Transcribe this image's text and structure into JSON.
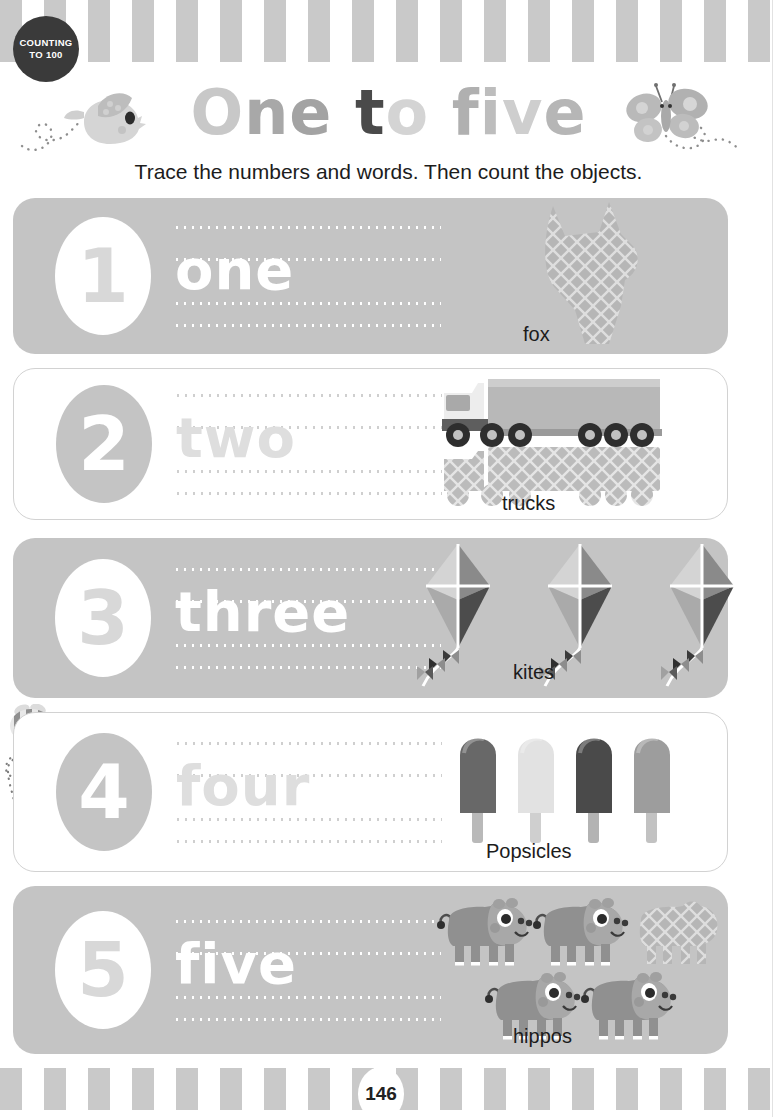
{
  "badge": {
    "line1": "COUNTING",
    "line2": "TO 100"
  },
  "header": {
    "title_parts": [
      {
        "text": "O",
        "color": "#c8c8c8"
      },
      {
        "text": "n",
        "color": "#a8a8a8"
      },
      {
        "text": "e",
        "color": "#a3a3a3"
      },
      {
        "text": " ",
        "color": "#ffffff"
      },
      {
        "text": "t",
        "color": "#4a4a4a"
      },
      {
        "text": "o",
        "color": "#d4d4d4"
      },
      {
        "text": " ",
        "color": "#ffffff"
      },
      {
        "text": "f",
        "color": "#b0b0b0"
      },
      {
        "text": "i",
        "color": "#bdbdbd"
      },
      {
        "text": "v",
        "color": "#cecece"
      },
      {
        "text": "e",
        "color": "#b6b6b6"
      }
    ],
    "title_plain": "One to five",
    "instruction": "Trace the numbers and words. Then count the objects."
  },
  "decorations": {
    "bird": "bird-icon",
    "butterfly": "butterfly-icon",
    "bee": "bee-icon",
    "dotted_trail": "dotted-trail"
  },
  "rows": [
    {
      "number": "1",
      "word": "one",
      "label": "fox",
      "count": 1,
      "object": "fox",
      "panel_style": "shaded",
      "object_art": "fox-silhouette"
    },
    {
      "number": "2",
      "word": "two",
      "label": "trucks",
      "count": 2,
      "object": "truck",
      "panel_style": "plain",
      "object_art": "truck"
    },
    {
      "number": "3",
      "word": "three",
      "label": "kites",
      "count": 3,
      "object": "kite",
      "panel_style": "shaded",
      "object_art": "kite"
    },
    {
      "number": "4",
      "word": "four",
      "label": "Popsicles",
      "count": 4,
      "object": "popsicle",
      "panel_style": "plain",
      "object_art": "popsicle"
    },
    {
      "number": "5",
      "word": "five",
      "label": "hippos",
      "count": 5,
      "object": "hippo",
      "panel_style": "shaded",
      "object_art": "hippo"
    }
  ],
  "footer": {
    "page_number": "146"
  },
  "colors": {
    "stripe": "#c9c9c9",
    "panel_shaded": "#c4c4c4",
    "panel_plain_border": "#d2d2d2",
    "badge_bg": "#3a3a3a",
    "text": "#1c1c1c"
  }
}
